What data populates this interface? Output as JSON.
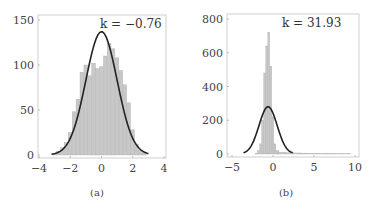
{
  "chart_data": [
    {
      "type": "bar",
      "title": "",
      "caption": "(a)",
      "annotation": "k = −0.76",
      "xlabel": "",
      "ylabel": "",
      "xlim": [
        -4,
        4
      ],
      "ylim": [
        0,
        150
      ],
      "xticks": [
        "−4",
        "−2",
        "0",
        "2",
        "4"
      ],
      "yticks": [
        "0",
        "50",
        "100",
        "150"
      ],
      "grid": false,
      "legend": null,
      "histogram": {
        "bin_centers": [
          -3.0,
          -2.75,
          -2.5,
          -2.25,
          -2.0,
          -1.75,
          -1.5,
          -1.25,
          -1.0,
          -0.75,
          -0.5,
          -0.25,
          0.0,
          0.25,
          0.5,
          0.75,
          1.0,
          1.25,
          1.5,
          1.75,
          2.0,
          2.25,
          2.5,
          2.75
        ],
        "counts": [
          2,
          4,
          8,
          14,
          25,
          48,
          62,
          92,
          100,
          88,
          102,
          96,
          98,
          110,
          124,
          118,
          108,
          94,
          78,
          58,
          28,
          12,
          5,
          2
        ]
      },
      "fit_curve": {
        "type": "normal",
        "mean": 0.0,
        "std": 1.0,
        "peak": 137,
        "x_range": [
          -3.2,
          3.0
        ]
      }
    },
    {
      "type": "bar",
      "title": "",
      "caption": "(b)",
      "annotation": "k = 31.93",
      "xlabel": "",
      "ylabel": "",
      "xlim": [
        -5,
        10
      ],
      "ylim": [
        0,
        800
      ],
      "xticks": [
        "−5",
        "0",
        "5",
        "10"
      ],
      "yticks": [
        "0",
        "200",
        "400",
        "600",
        "800"
      ],
      "grid": false,
      "legend": null,
      "histogram": {
        "bin_centers": [
          -2.0,
          -1.75,
          -1.5,
          -1.25,
          -1.0,
          -0.75,
          -0.5,
          -0.25,
          0.0,
          0.25,
          0.5,
          1.0,
          2.0,
          3.0,
          4.0,
          5.0,
          6.0,
          7.0,
          8.0,
          9.0
        ],
        "counts": [
          5,
          20,
          60,
          200,
          480,
          640,
          720,
          520,
          220,
          60,
          20,
          10,
          8,
          6,
          5,
          4,
          3,
          3,
          2,
          2
        ]
      },
      "fit_curve": {
        "type": "normal",
        "mean": -0.6,
        "std": 1.1,
        "peak": 280,
        "x_range": [
          -3.6,
          2.4
        ]
      }
    }
  ]
}
